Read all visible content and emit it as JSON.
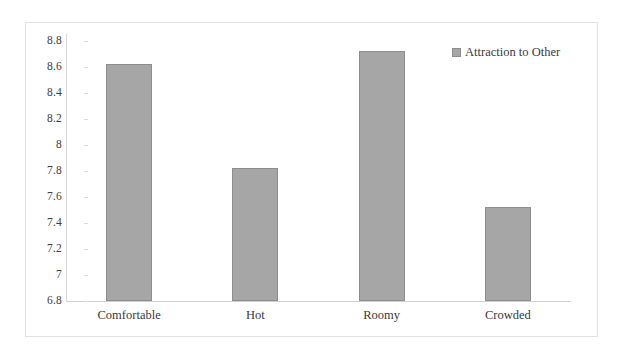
{
  "chart_data": {
    "type": "bar",
    "title": "",
    "xlabel": "",
    "ylabel": "",
    "categories": [
      "Comfortable",
      "Hot",
      "Roomy",
      "Crowded"
    ],
    "series": [
      {
        "name": "Attraction to Other",
        "values": [
          8.62,
          7.82,
          8.72,
          7.52
        ],
        "color": "#a6a6a6"
      }
    ],
    "ylim": [
      6.8,
      8.8
    ],
    "yticks": [
      "8.8",
      "8.6",
      "8.4",
      "8.2",
      "8",
      "7.8",
      "7.6",
      "7.4",
      "7.2",
      "7",
      "6.8"
    ],
    "ytick_values": [
      8.8,
      8.6,
      8.4,
      8.2,
      8.0,
      7.8,
      7.6,
      7.4,
      7.2,
      7.0,
      6.8
    ],
    "grid": false,
    "legend": {
      "position": "top-right",
      "entries": [
        {
          "label": "Attraction to Other",
          "swatch_name": "legend-swatch-attraction-to-other",
          "color": "#a6a6a6"
        }
      ]
    },
    "bar_border_color": "#8d8d8d",
    "frame_color": "#e2e2e2",
    "background": "#ffffff"
  }
}
